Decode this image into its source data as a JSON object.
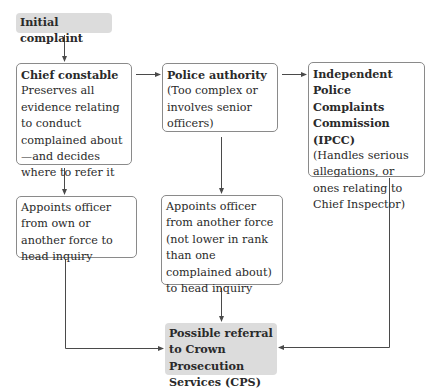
{
  "diagram": {
    "type": "flowchart",
    "nodes": {
      "start": {
        "label": "Initial complaint"
      },
      "chief_constable": {
        "title": "Chief constable",
        "body": "Preserves all evidence relating to conduct complained about—and decides where to refer it"
      },
      "police_authority": {
        "title": "Police authority",
        "body": "(Too complex or involves senior officers)"
      },
      "ipcc": {
        "title": "Independent Police Complaints Commission (IPCC)",
        "body": "(Handles serious allegations, or ones relating to Chief Inspector)"
      },
      "appoint_own": {
        "body": "Appoints officer from own or another force to head inquiry"
      },
      "appoint_other": {
        "body": "Appoints officer from another force (not lower in rank than one complained about) to head inquiry"
      },
      "cps": {
        "label": "Possible referral to Crown Prosecution Services (CPS)"
      }
    },
    "edges": [
      {
        "from": "start",
        "to": "chief_constable"
      },
      {
        "from": "chief_constable",
        "to": "police_authority"
      },
      {
        "from": "police_authority",
        "to": "ipcc"
      },
      {
        "from": "chief_constable",
        "to": "appoint_own"
      },
      {
        "from": "police_authority",
        "to": "appoint_other"
      },
      {
        "from": "appoint_own",
        "to": "cps"
      },
      {
        "from": "appoint_other",
        "to": "cps"
      },
      {
        "from": "ipcc",
        "to": "cps"
      }
    ],
    "colors": {
      "line": "#4a4a4a",
      "box_border": "#8a8a8a",
      "shaded_fill": "#dcdcdc"
    }
  }
}
